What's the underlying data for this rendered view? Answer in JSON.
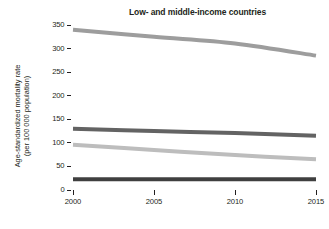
{
  "chart_data": {
    "type": "line",
    "title": "Low- and middle-income countries",
    "xlabel": "",
    "ylabel": "Age-standardized mortality rate (per 100 000 population)",
    "ylabel_line1": "Age-standardized mortality rate",
    "ylabel_line2": "(per 100 000 population)",
    "x": [
      2000,
      2005,
      2010,
      2015
    ],
    "xlim": [
      2000,
      2015
    ],
    "ylim": [
      0,
      350
    ],
    "xticks": [
      "2000",
      "2005",
      "2010",
      "2015"
    ],
    "yticks": [
      "0",
      "50",
      "100",
      "150",
      "200",
      "250",
      "300",
      "350"
    ],
    "grid": false,
    "legend": "none",
    "series": [
      {
        "name": "series-1",
        "color": "#9d9d9d",
        "values": [
          340,
          325,
          311,
          285
        ]
      },
      {
        "name": "series-2",
        "color": "#636363",
        "values": [
          130,
          125,
          121,
          115
        ]
      },
      {
        "name": "series-3",
        "color": "#bdbdbd",
        "values": [
          96,
          85,
          74,
          65
        ]
      },
      {
        "name": "series-4",
        "color": "#3f3f3f",
        "values": [
          23,
          23,
          23,
          23
        ]
      }
    ]
  }
}
